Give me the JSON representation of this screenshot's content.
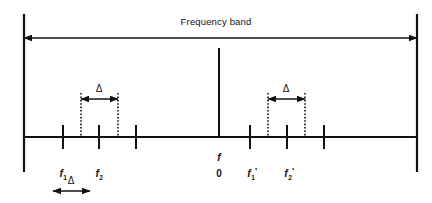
{
  "figure": {
    "kind": "frequency-band-spectrum-diagram",
    "width": 432,
    "height": 203,
    "background": "#ffffff",
    "ink_color": "#111111"
  },
  "title": {
    "text": "Frequency band",
    "x": 216,
    "y": 17
  },
  "span_arrow": {
    "name": "frequency-band-span",
    "y": 38,
    "x1": 24,
    "x2": 417,
    "double_headed": true
  },
  "boundaries": {
    "left": {
      "x": 24,
      "y_top": 14,
      "y_bottom": 172
    },
    "right": {
      "x": 417,
      "y_top": 14,
      "y_bottom": 172
    }
  },
  "axis": {
    "y": 137,
    "x1": 24,
    "x2": 417
  },
  "center_line": {
    "name": "center-frequency-line",
    "x": 219,
    "y_top": 48,
    "y_bottom": 137
  },
  "ticks": [
    {
      "name": "tick-f1",
      "x": 63,
      "label": "f",
      "sub": "1",
      "prime": false
    },
    {
      "name": "tick-f2",
      "x": 99,
      "label": "f",
      "sub": "2",
      "prime": false
    },
    {
      "name": "tick-left-3",
      "x": 136,
      "label": "",
      "sub": "",
      "prime": false
    },
    {
      "name": "tick-f1-prime",
      "x": 250,
      "label": "f",
      "sub": "1",
      "prime": true
    },
    {
      "name": "tick-f2-prime",
      "x": 287,
      "label": "f",
      "sub": "2",
      "prime": true
    },
    {
      "name": "tick-right-3",
      "x": 324,
      "label": "",
      "sub": "",
      "prime": false
    }
  ],
  "tick_geometry": {
    "above": 12,
    "below": 12
  },
  "guides": [
    {
      "name": "guide-left-a",
      "x": 81,
      "y_top": 93,
      "y_bottom": 137
    },
    {
      "name": "guide-left-b",
      "x": 118,
      "y_top": 93,
      "y_bottom": 137
    },
    {
      "name": "guide-right-a",
      "x": 268,
      "y_top": 93,
      "y_bottom": 137
    },
    {
      "name": "guide-right-b",
      "x": 305,
      "y_top": 93,
      "y_bottom": 137
    }
  ],
  "delta_markers": [
    {
      "name": "delta-left-upper",
      "symbol": "Δ",
      "label_x": 99,
      "label_y": 84,
      "arrow_y": 99,
      "x1": 81,
      "x2": 118
    },
    {
      "name": "delta-right-upper",
      "symbol": "Δ",
      "label_x": 286,
      "label_y": 84,
      "arrow_y": 99,
      "x1": 268,
      "x2": 305
    },
    {
      "name": "delta-bottom",
      "symbol": "Δ",
      "label_x": 71,
      "label_y": 176,
      "arrow_y": 191,
      "x1": 53,
      "x2": 90
    }
  ],
  "center_label": {
    "name": "center-frequency-label",
    "f_text": "f",
    "f_x": 219,
    "f_y": 152,
    "zero_text": "0",
    "zero_x": 219,
    "zero_y": 169
  },
  "tick_labels": [
    {
      "name": "label-f1",
      "text": "f",
      "sub": "1",
      "prime": "",
      "x": 63,
      "y": 168
    },
    {
      "name": "label-f2",
      "text": "f",
      "sub": "2",
      "prime": "",
      "x": 99,
      "y": 168
    },
    {
      "name": "label-f1-prime",
      "text": "f",
      "sub": "1",
      "prime": "'",
      "x": 252,
      "y": 168
    },
    {
      "name": "label-f2-prime",
      "text": "f",
      "sub": "2",
      "prime": "'",
      "x": 289,
      "y": 168
    }
  ]
}
